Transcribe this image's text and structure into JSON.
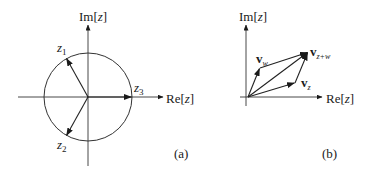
{
  "panels": [
    {
      "id": "a",
      "caption": "(a)",
      "axes": {
        "imag_label_prefix": "Im[",
        "imag_label_var": "z",
        "imag_label_suffix": "]",
        "real_label_prefix": "Re[",
        "real_label_var": "z",
        "real_label_suffix": "]"
      },
      "circle": {
        "cx": 88,
        "cy": 97,
        "r": 44
      },
      "vectors": [
        {
          "name": "z1",
          "letter": "z",
          "subscript": "1",
          "angle_deg": 120
        },
        {
          "name": "z2",
          "letter": "z",
          "subscript": "2",
          "angle_deg": 240
        },
        {
          "name": "z3",
          "letter": "z",
          "subscript": "3",
          "angle_deg": 0
        }
      ]
    },
    {
      "id": "b",
      "caption": "(b)",
      "axes": {
        "imag_label_prefix": "Im[",
        "imag_label_var": "z",
        "imag_label_suffix": "]",
        "real_label_prefix": "Re[",
        "real_label_var": "z",
        "real_label_suffix": "]"
      },
      "vectors": [
        {
          "name": "v_w",
          "letter": "v",
          "subscript": "w"
        },
        {
          "name": "v_z",
          "letter": "v",
          "subscript": "z"
        },
        {
          "name": "v_z+w",
          "letter": "v",
          "subscript": "z+w"
        }
      ]
    }
  ],
  "colors": {
    "line": "#222222",
    "background": "#ffffff"
  }
}
